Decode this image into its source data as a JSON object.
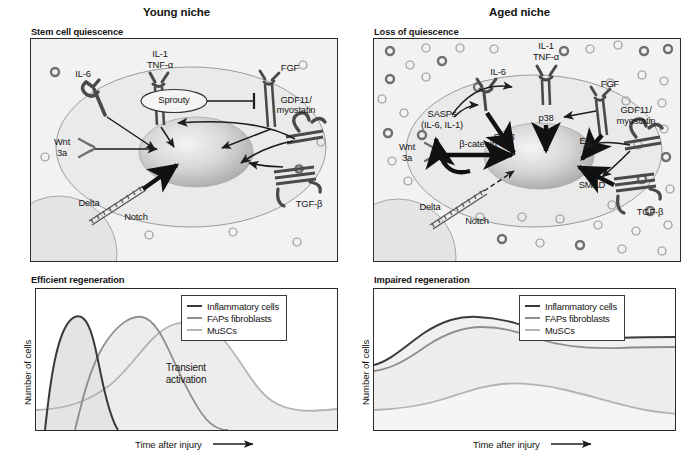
{
  "figure": {
    "panels": [
      {
        "id": "young",
        "title": "Young niche",
        "diagram_subtitle": "Stem cell quiescence",
        "chart_subtitle": "Efficient regeneration"
      },
      {
        "id": "aged",
        "title": "Aged niche",
        "diagram_subtitle": "Loss of quiescence",
        "chart_subtitle": "Impaired regeneration"
      }
    ]
  },
  "young_diagram": {
    "labels": {
      "il1": "IL-1",
      "tnfa": "TNF-α",
      "il6": "IL-6",
      "sprouty": "Sprouty",
      "fgf": "FGF",
      "gdf11_line1": "GDF11/",
      "gdf11_line2": "myostatin",
      "wnt_line1": "Wnt",
      "wnt_line2": "3a",
      "delta": "Delta",
      "notch": "Notch",
      "tgfb": "TGF-β"
    }
  },
  "aged_diagram": {
    "labels": {
      "il1": "IL-1",
      "tnfa": "TNF-α",
      "il6": "IL-6",
      "sasps_line1": "SASPs",
      "sasps_line2": "(IL-6, IL-1)",
      "stat3": "Stat3",
      "p38": "p38",
      "fgf": "FGF",
      "erk": "ERK",
      "gdf11_line1": "GDF11/",
      "gdf11_line2": "myostatin",
      "wnt_line1": "Wnt",
      "wnt_line2": "3a",
      "bcatenin": "β-catenin",
      "delta": "Delta",
      "notch": "Notch",
      "smad": "SMAD",
      "tgfb": "TGF-β"
    }
  },
  "colors": {
    "inflammatory": "#3a3a3a",
    "faps": "#8e8e8e",
    "muscs": "#b4b4b4",
    "panel_bg": "#f2f2f2",
    "border": "#2b2b2b",
    "fill_light": "#ededed"
  },
  "chart_data": [
    {
      "type": "line",
      "id": "efficient-regeneration",
      "title": "Efficient regeneration",
      "xlabel": "Time after injury",
      "ylabel": "Number of cells",
      "xlim": [
        0,
        100
      ],
      "ylim": [
        0,
        100
      ],
      "grid": false,
      "legend_position": "top-right",
      "annotations": [
        {
          "text": "Transient activation",
          "x": 58,
          "y": 35
        }
      ],
      "series": [
        {
          "name": "Inflammatory cells",
          "color": "#3a3a3a",
          "values": [
            {
              "x": 2,
              "y": 0
            },
            {
              "x": 6,
              "y": 28
            },
            {
              "x": 10,
              "y": 68
            },
            {
              "x": 14,
              "y": 86
            },
            {
              "x": 18,
              "y": 82
            },
            {
              "x": 24,
              "y": 60
            },
            {
              "x": 31,
              "y": 36
            },
            {
              "x": 38,
              "y": 18
            },
            {
              "x": 46,
              "y": 6
            },
            {
              "x": 55,
              "y": 1
            },
            {
              "x": 64,
              "y": 0
            }
          ]
        },
        {
          "name": "FAPs fibroblasts",
          "color": "#8e8e8e",
          "values": [
            {
              "x": 13,
              "y": 0
            },
            {
              "x": 18,
              "y": 22
            },
            {
              "x": 24,
              "y": 58
            },
            {
              "x": 31,
              "y": 82
            },
            {
              "x": 37,
              "y": 85
            },
            {
              "x": 44,
              "y": 70
            },
            {
              "x": 52,
              "y": 46
            },
            {
              "x": 60,
              "y": 22
            },
            {
              "x": 68,
              "y": 6
            },
            {
              "x": 74,
              "y": 0
            }
          ]
        },
        {
          "name": "MuSCs",
          "color": "#b4b4b4",
          "values": [
            {
              "x": 0,
              "y": 14
            },
            {
              "x": 12,
              "y": 16
            },
            {
              "x": 24,
              "y": 26
            },
            {
              "x": 36,
              "y": 50
            },
            {
              "x": 48,
              "y": 72
            },
            {
              "x": 56,
              "y": 78
            },
            {
              "x": 66,
              "y": 72
            },
            {
              "x": 76,
              "y": 52
            },
            {
              "x": 86,
              "y": 28
            },
            {
              "x": 94,
              "y": 17
            },
            {
              "x": 100,
              "y": 15
            }
          ]
        }
      ]
    },
    {
      "type": "line",
      "id": "impaired-regeneration",
      "title": "Impaired regeneration",
      "xlabel": "Time after injury",
      "ylabel": "Number of cells",
      "xlim": [
        0,
        100
      ],
      "ylim": [
        0,
        100
      ],
      "grid": false,
      "legend_position": "top-right",
      "annotations": [],
      "series": [
        {
          "name": "Inflammatory cells",
          "color": "#3a3a3a",
          "values": [
            {
              "x": 0,
              "y": 46
            },
            {
              "x": 8,
              "y": 52
            },
            {
              "x": 16,
              "y": 66
            },
            {
              "x": 24,
              "y": 76
            },
            {
              "x": 32,
              "y": 80
            },
            {
              "x": 42,
              "y": 79
            },
            {
              "x": 52,
              "y": 74
            },
            {
              "x": 62,
              "y": 70
            },
            {
              "x": 74,
              "y": 68
            },
            {
              "x": 88,
              "y": 68
            },
            {
              "x": 100,
              "y": 69
            }
          ]
        },
        {
          "name": "FAPs fibroblasts",
          "color": "#8e8e8e",
          "values": [
            {
              "x": 0,
              "y": 42
            },
            {
              "x": 8,
              "y": 44
            },
            {
              "x": 16,
              "y": 54
            },
            {
              "x": 24,
              "y": 68
            },
            {
              "x": 33,
              "y": 74
            },
            {
              "x": 43,
              "y": 73
            },
            {
              "x": 54,
              "y": 68
            },
            {
              "x": 66,
              "y": 64
            },
            {
              "x": 80,
              "y": 63
            },
            {
              "x": 100,
              "y": 64
            }
          ]
        },
        {
          "name": "MuSCs",
          "color": "#b4b4b4",
          "values": [
            {
              "x": 0,
              "y": 12
            },
            {
              "x": 12,
              "y": 12
            },
            {
              "x": 24,
              "y": 16
            },
            {
              "x": 36,
              "y": 25
            },
            {
              "x": 48,
              "y": 29
            },
            {
              "x": 58,
              "y": 28
            },
            {
              "x": 70,
              "y": 22
            },
            {
              "x": 82,
              "y": 14
            },
            {
              "x": 92,
              "y": 9
            },
            {
              "x": 100,
              "y": 8
            }
          ]
        }
      ]
    }
  ],
  "legend": {
    "entries": [
      {
        "label": "Inflammatory cells",
        "color": "#3a3a3a"
      },
      {
        "label": "FAPs fibroblasts",
        "color": "#8e8e8e"
      },
      {
        "label": "MuSCs",
        "color": "#b4b4b4"
      }
    ]
  }
}
